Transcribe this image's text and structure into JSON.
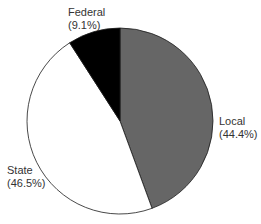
{
  "chart_data": {
    "type": "pie",
    "title": "",
    "start_angle_deg": 0,
    "direction": "clockwise",
    "slices": [
      {
        "name": "Local",
        "value": 44.4,
        "label": "Local",
        "pct_label": "(44.4%)",
        "color": "#666666"
      },
      {
        "name": "State",
        "value": 46.5,
        "label": "State",
        "pct_label": "(46.5%)",
        "color": "#ffffff"
      },
      {
        "name": "Federal",
        "value": 9.1,
        "label": "Federal",
        "pct_label": "(9.1%)",
        "color": "#000000"
      }
    ],
    "legend": "none (direct labels)"
  },
  "labels": {
    "local": {
      "name": "Local",
      "pct": "(44.4%)"
    },
    "state": {
      "name": "State",
      "pct": "(46.5%)"
    },
    "federal": {
      "name": "Federal",
      "pct": "(9.1%)"
    }
  }
}
